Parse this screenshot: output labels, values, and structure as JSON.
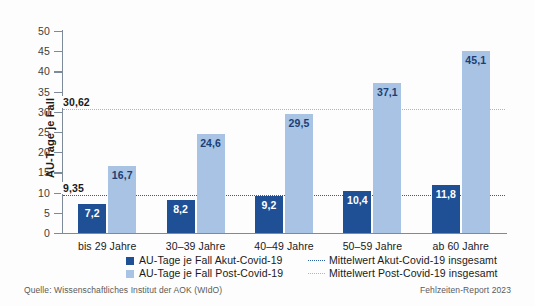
{
  "chart_data": {
    "type": "bar",
    "title": "",
    "xlabel": "",
    "ylabel": "AU-Tage je Fall",
    "ylim": [
      0,
      50
    ],
    "ytick_step": 5,
    "yticks": [
      "0",
      "5",
      "10",
      "15",
      "20",
      "25",
      "30",
      "35",
      "40",
      "45",
      "50"
    ],
    "grid": false,
    "legend_position": "bottom",
    "categories": [
      "bis 29 Jahre",
      "30–39 Jahre",
      "40–49 Jahre",
      "50–59 Jahre",
      "ab 60 Jahre"
    ],
    "series": [
      {
        "name": "AU-Tage je Fall Akut-Covid-19",
        "color": "#1f5095",
        "values": [
          7.2,
          8.2,
          9.2,
          10.4,
          11.8
        ],
        "labels": [
          "7,2",
          "8,2",
          "9,2",
          "10,4",
          "11,8"
        ]
      },
      {
        "name": "AU-Tage je Fall Post-Covid-19",
        "color": "#a8c3e4",
        "values": [
          16.7,
          24.6,
          29.5,
          37.1,
          45.1
        ],
        "labels": [
          "16,7",
          "24,6",
          "29,5",
          "37,1",
          "45,1"
        ]
      }
    ],
    "reference_lines": [
      {
        "name": "Mittelwert Akut-Covid-19 insgesamt",
        "value": 9.35,
        "label": "9,35",
        "color": "#2b5fa3"
      },
      {
        "name": "Mittelwert Post-Covid-19 insgesamt",
        "value": 30.62,
        "label": "30,62",
        "color": "#9fb8d8"
      }
    ]
  },
  "legend": {
    "items": [
      {
        "label": "AU-Tage je Fall Akut-Covid-19",
        "kind": "swatch",
        "color": "#1f5095"
      },
      {
        "label": "AU-Tage je Fall Post-Covid-19",
        "kind": "swatch",
        "color": "#a8c3e4"
      },
      {
        "label": "Mittelwert Akut-Covid-19 insgesamt",
        "kind": "dotted",
        "color": "#2b5fa3"
      },
      {
        "label": "Mittelwert Post-Covid-19 insgesamt",
        "kind": "dotted",
        "color": "#9fb8d8"
      }
    ]
  },
  "footer": {
    "source": "Quelle: Wissenschaftliches Institut der AOK (WIdO)",
    "report": "Fehlzeiten-Report 2023"
  }
}
